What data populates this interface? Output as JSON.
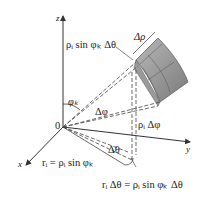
{
  "diagram": {
    "axes": {
      "z": "z",
      "y": "y",
      "x": "x",
      "origin": "0"
    },
    "labels": {
      "delta_rho": "Δρ",
      "arc_top": "ρᵢ sin φₖ Δθ",
      "phi_k": "φₖ",
      "delta_phi": "Δφ",
      "rho_delta_phi": "ρᵢ Δφ",
      "delta_theta": "Δθ",
      "r_i": "rᵢ = ρᵢ sin φₖ",
      "r_delta_theta": "rᵢ Δθ = ρᵢ sin φₖ Δθ"
    },
    "colors": {
      "wedge_fill": "#8c8c8c",
      "wedge_light": "#b5b5b5",
      "line": "#333333"
    }
  }
}
